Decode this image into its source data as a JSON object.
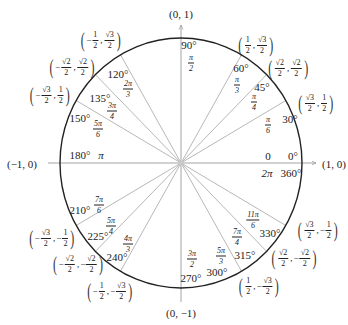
{
  "axis_points": {
    "top": "(0, 1)",
    "bottom": "(0, −1)",
    "left": "(−1, 0)",
    "right": "(1, 0)"
  },
  "colors": {
    "circle": "#222222",
    "radial": "#b8b8b8",
    "axis": "#9a9a9a"
  },
  "angles": [
    {
      "deg": "0°",
      "rad_plain": "0",
      "alt_deg": "360°",
      "alt_rad": "2π"
    },
    {
      "deg": "30°",
      "rad_num": "π",
      "rad_den": "6",
      "x_sign": "",
      "x_num": "√3",
      "x_den": "2",
      "y_sign": "",
      "y_num": "1",
      "y_den": "2"
    },
    {
      "deg": "45°",
      "rad_num": "π",
      "rad_den": "4",
      "x_sign": "",
      "x_num": "√2",
      "x_den": "2",
      "y_sign": "",
      "y_num": "√2",
      "y_den": "2"
    },
    {
      "deg": "60°",
      "rad_num": "π",
      "rad_den": "3",
      "x_sign": "",
      "x_num": "1",
      "x_den": "2",
      "y_sign": "",
      "y_num": "√3",
      "y_den": "2"
    },
    {
      "deg": "90°",
      "rad_num": "π",
      "rad_den": "2"
    },
    {
      "deg": "120°",
      "rad_num": "2π",
      "rad_den": "3",
      "x_sign": "−",
      "x_num": "1",
      "x_den": "2",
      "y_sign": "",
      "y_num": "√3",
      "y_den": "2"
    },
    {
      "deg": "135°",
      "rad_num": "3π",
      "rad_den": "4",
      "x_sign": "−",
      "x_num": "√2",
      "x_den": "2",
      "y_sign": "",
      "y_num": "√2",
      "y_den": "2"
    },
    {
      "deg": "150°",
      "rad_num": "5π",
      "rad_den": "6",
      "x_sign": "−",
      "x_num": "√3",
      "x_den": "2",
      "y_sign": "",
      "y_num": "1",
      "y_den": "2"
    },
    {
      "deg": "180°",
      "rad_plain": "π"
    },
    {
      "deg": "210°",
      "rad_num": "7π",
      "rad_den": "6",
      "x_sign": "−",
      "x_num": "√3",
      "x_den": "2",
      "y_sign": "−",
      "y_num": "1",
      "y_den": "2"
    },
    {
      "deg": "225°",
      "rad_num": "5π",
      "rad_den": "4",
      "x_sign": "−",
      "x_num": "√2",
      "x_den": "2",
      "y_sign": "−",
      "y_num": "√2",
      "y_den": "2"
    },
    {
      "deg": "240°",
      "rad_num": "4π",
      "rad_den": "3",
      "x_sign": "−",
      "x_num": "1",
      "x_den": "2",
      "y_sign": "−",
      "y_num": "√3",
      "y_den": "2"
    },
    {
      "deg": "270°",
      "rad_num": "3π",
      "rad_den": "2"
    },
    {
      "deg": "300°",
      "rad_num": "5π",
      "rad_den": "3",
      "x_sign": "",
      "x_num": "1",
      "x_den": "2",
      "y_sign": "−",
      "y_num": "√3",
      "y_den": "2"
    },
    {
      "deg": "315°",
      "rad_num": "7π",
      "rad_den": "4",
      "x_sign": "",
      "x_num": "√2",
      "x_den": "2",
      "y_sign": "−",
      "y_num": "√2",
      "y_den": "2"
    },
    {
      "deg": "330°",
      "rad_num": "11π",
      "rad_den": "6",
      "x_sign": "",
      "x_num": "√3",
      "x_den": "2",
      "y_sign": "−",
      "y_num": "1",
      "y_den": "2"
    }
  ],
  "radial_angles_deg": [
    30,
    45,
    60,
    120,
    135,
    150,
    210,
    225,
    240,
    300,
    315,
    330
  ]
}
